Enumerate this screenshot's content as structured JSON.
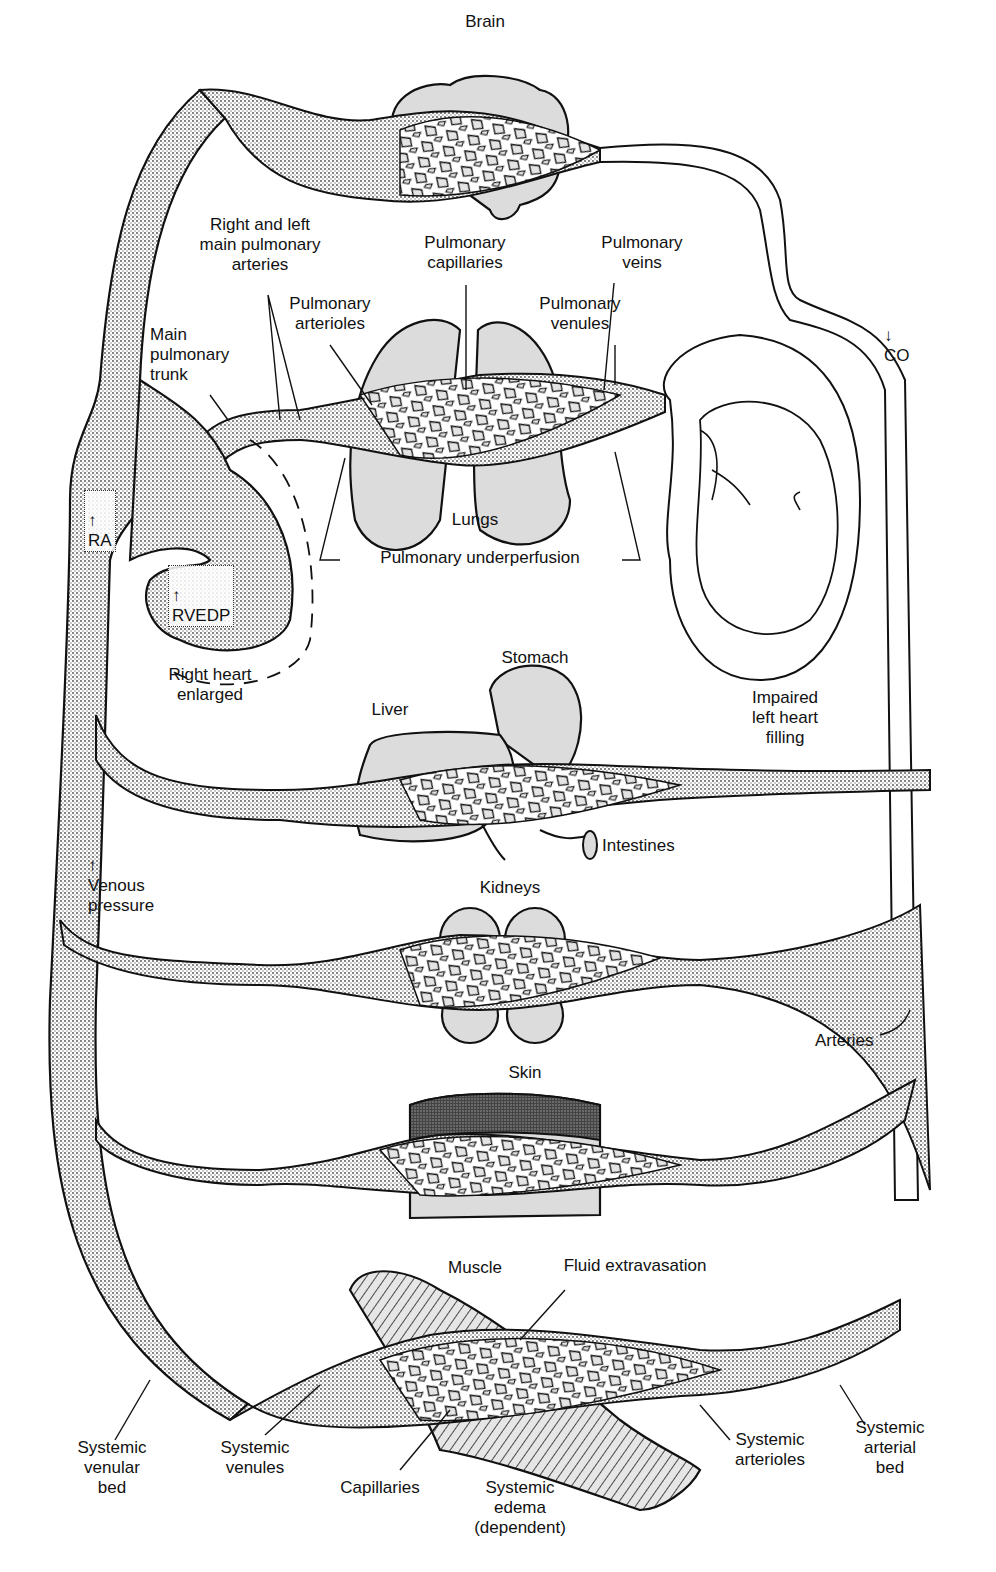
{
  "figure": {
    "colors": {
      "ink": "#111111",
      "venous_stipple": "#5a5a5a",
      "organ_fill": "#d9d9d9",
      "skin_dark": "#3a3a3a",
      "background": "#ffffff"
    }
  },
  "labels": {
    "brain": "Brain",
    "right_left_main_pulm_arteries": "Right and left\nmain pulmonary\narteries",
    "pulm_capillaries": "Pulmonary\ncapillaries",
    "pulm_veins": "Pulmonary\nveins",
    "pulm_arterioles": "Pulmonary\narterioles",
    "pulm_venules": "Pulmonary\nvenules",
    "main_pulm_trunk": "Main\npulmonary\ntrunk",
    "co": "CO",
    "ra": "RA",
    "rvedp": "RVEDP",
    "lungs": "Lungs",
    "pulm_underperfusion": "Pulmonary underperfusion",
    "right_heart_enlarged": "Right heart\nenlarged",
    "stomach": "Stomach",
    "liver": "Liver",
    "impaired_left_heart_filling": "Impaired\nleft heart\nfilling",
    "intestines": "Intestines",
    "venous_pressure": "Venous\npressure",
    "kidneys": "Kidneys",
    "arteries": "Arteries",
    "skin": "Skin",
    "muscle": "Muscle",
    "fluid_extravasation": "Fluid extravasation",
    "systemic_venular_bed": "Systemic\nvenular\nbed",
    "systemic_venules": "Systemic\nvenules",
    "capillaries": "Capillaries",
    "systemic_edema": "Systemic\nedema\n(dependent)",
    "systemic_arterioles": "Systemic\narterioles",
    "systemic_arterial_bed": "Systemic\narterial\nbed"
  },
  "indicators": {
    "ra": "increase",
    "rvedp": "increase",
    "venous_pressure": "increase",
    "co": "decrease"
  },
  "icons": {
    "up_arrow": "↑",
    "down_arrow": "↓"
  }
}
